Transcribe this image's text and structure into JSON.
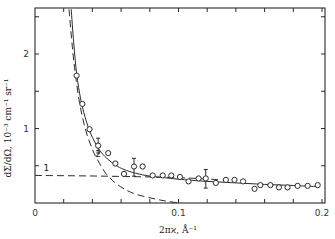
{
  "chart_data": {
    "type": "scatter",
    "title": "",
    "xlabel": "2πϰ, Å⁻¹",
    "ylabel": "dΣ/dΩ, 10⁻³ cm⁻¹ sr⁻¹",
    "xlim": [
      0,
      0.2
    ],
    "ylim": [
      0,
      2.6
    ],
    "grid": false,
    "legend": "none",
    "x_ticks": [
      0,
      0.02,
      0.04,
      0.06,
      0.08,
      0.1,
      0.12,
      0.14,
      0.16,
      0.18,
      0.2
    ],
    "x_tick_labels": [
      {
        "value": 0,
        "label": "0"
      },
      {
        "value": 0.1,
        "label": "0.1"
      },
      {
        "value": 0.2,
        "label": "0.2"
      }
    ],
    "y_ticks": [
      0.5,
      1,
      1.5,
      2,
      2.5
    ],
    "y_tick_labels": [
      {
        "value": 1,
        "label": "1"
      },
      {
        "value": 2,
        "label": "2"
      }
    ],
    "series": [
      {
        "name": "experimental points",
        "style": "open-circle",
        "x": [
          0.029,
          0.033,
          0.038,
          0.044,
          0.051,
          0.056,
          0.062,
          0.069,
          0.075,
          0.082,
          0.089,
          0.095,
          0.101,
          0.107,
          0.114,
          0.119,
          0.126,
          0.133,
          0.139,
          0.145,
          0.153,
          0.157,
          0.164,
          0.17,
          0.176,
          0.183,
          0.19,
          0.197
        ],
        "y": [
          1.71,
          1.33,
          0.99,
          0.77,
          0.67,
          0.53,
          0.39,
          0.49,
          0.49,
          0.37,
          0.37,
          0.37,
          0.35,
          0.29,
          0.33,
          0.33,
          0.27,
          0.31,
          0.31,
          0.29,
          0.19,
          0.24,
          0.24,
          0.21,
          0.21,
          0.23,
          0.23,
          0.24
        ],
        "error_bars": [
          {
            "x": 0.044,
            "y": 0.77,
            "low": 0.67,
            "high": 0.87
          },
          {
            "x": 0.069,
            "y": 0.49,
            "low": 0.36,
            "high": 0.6
          },
          {
            "x": 0.119,
            "y": 0.33,
            "low": 0.2,
            "high": 0.45
          }
        ]
      },
      {
        "name": "fit (sum)",
        "style": "solid",
        "x": [
          0.0252,
          0.027,
          0.029,
          0.032,
          0.036,
          0.04,
          0.045,
          0.05,
          0.056,
          0.062,
          0.07,
          0.08,
          0.09,
          0.1,
          0.12,
          0.14,
          0.16,
          0.18,
          0.197
        ],
        "y": [
          2.6,
          2.15,
          1.74,
          1.38,
          1.08,
          0.88,
          0.71,
          0.6,
          0.51,
          0.45,
          0.4,
          0.36,
          0.34,
          0.32,
          0.29,
          0.27,
          0.25,
          0.235,
          0.22
        ]
      },
      {
        "name": "1",
        "style": "dashed",
        "x": [
          0,
          0.05,
          0.1,
          0.13
        ],
        "y": [
          0.37,
          0.36,
          0.34,
          0.31
        ]
      },
      {
        "name": "2",
        "style": "dashed",
        "x": [
          0.0237,
          0.026,
          0.028,
          0.031,
          0.035,
          0.04,
          0.045,
          0.05,
          0.056,
          0.062,
          0.07,
          0.08,
          0.09,
          0.1
        ],
        "y": [
          2.6,
          2.1,
          1.75,
          1.35,
          1.0,
          0.72,
          0.53,
          0.38,
          0.27,
          0.19,
          0.12,
          0.07,
          0.03,
          0.0
        ]
      }
    ],
    "annotations": [
      {
        "text": "1",
        "x": 0.006,
        "y": 0.43
      },
      {
        "text": "2",
        "x": 0.042,
        "y": 0.62
      }
    ]
  }
}
